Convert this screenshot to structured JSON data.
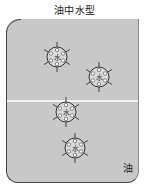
{
  "title": "油中水型",
  "oil_label": "油",
  "droplet_label": "水",
  "colors": {
    "oil_background": "#c8c8c8",
    "border": "#444444",
    "surface_line": "#f4f4f4",
    "droplet_fill": "#d8d8d8"
  },
  "droplets": [
    {
      "cx": 57,
      "cy": 57,
      "r": 10
    },
    {
      "cx": 99,
      "cy": 77,
      "r": 10
    },
    {
      "cx": 66,
      "cy": 112,
      "r": 10
    },
    {
      "cx": 75,
      "cy": 148,
      "r": 10
    }
  ]
}
